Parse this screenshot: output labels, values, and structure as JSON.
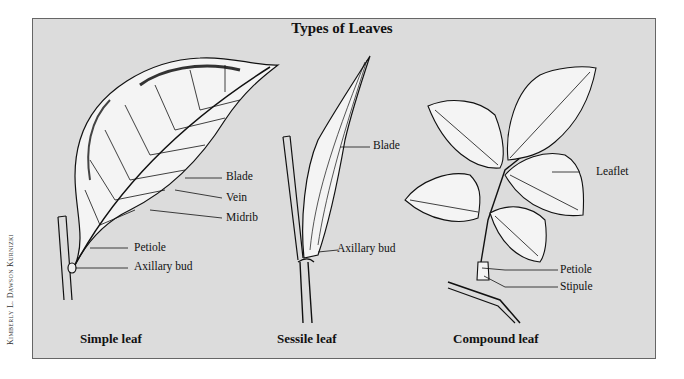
{
  "title": "Types of Leaves",
  "credit": "Kimberly L. Dawson Kurnizki",
  "colors": {
    "background": "#dcdcdc",
    "ink": "#111111",
    "leaf_fill": "#f4f4f4"
  },
  "panels": [
    {
      "caption": "Simple leaf",
      "labels": [
        "Blade",
        "Vein",
        "Midrib",
        "Petiole",
        "Axillary bud"
      ]
    },
    {
      "caption": "Sessile leaf",
      "labels": [
        "Blade",
        "Axillary bud"
      ]
    },
    {
      "caption": "Compound leaf",
      "labels": [
        "Leaflet",
        "Petiole",
        "Stipule"
      ]
    }
  ]
}
